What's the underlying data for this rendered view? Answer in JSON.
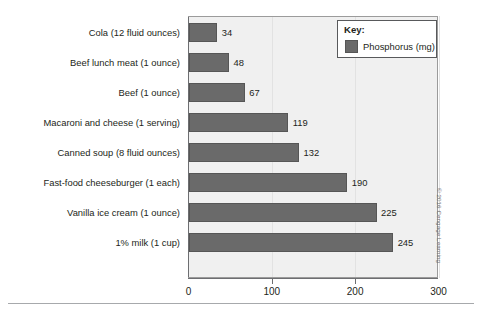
{
  "chart_data": {
    "type": "bar",
    "orientation": "horizontal",
    "title": "",
    "xlabel": "",
    "ylabel": "",
    "xlim": [
      0,
      300
    ],
    "xticks": [
      0,
      100,
      200,
      300
    ],
    "xtick_labels": [
      "0",
      "100",
      "200",
      "300"
    ],
    "grid": true,
    "legend_position": "top-right",
    "legend_title": "Key:",
    "series": [
      {
        "name": "Phosphorus (mg)",
        "color": "#6a6a6a",
        "values": [
          34,
          48,
          67,
          119,
          132,
          190,
          225,
          245
        ]
      }
    ],
    "categories": [
      "Cola (12 fluid ounces)",
      "Beef lunch meat (1 ounce)",
      "Beef (1 ounce)",
      "Macaroni and cheese (1 serving)",
      "Canned soup (8 fluid ounces)",
      "Fast-food cheeseburger (1 each)",
      "Vanilla ice cream (1 ounce)",
      "1% milk (1 cup)"
    ],
    "data_labels": [
      "34",
      "48",
      "67",
      "119",
      "132",
      "190",
      "225",
      "245"
    ]
  },
  "legend": {
    "title": "Key:",
    "items": [
      {
        "label": "Phosphorus (mg)",
        "color": "#6a6a6a"
      }
    ]
  },
  "axis": {
    "ticks": [
      {
        "label": "0",
        "value": 0
      },
      {
        "label": "100",
        "value": 100
      },
      {
        "label": "200",
        "value": 200
      },
      {
        "label": "300",
        "value": 300
      }
    ]
  },
  "rows": [
    {
      "label": "Cola (12 fluid ounces)",
      "value": 34,
      "value_label": "34"
    },
    {
      "label": "Beef lunch meat (1 ounce)",
      "value": 48,
      "value_label": "48"
    },
    {
      "label": "Beef (1 ounce)",
      "value": 67,
      "value_label": "67"
    },
    {
      "label": "Macaroni and cheese (1 serving)",
      "value": 119,
      "value_label": "119"
    },
    {
      "label": "Canned soup (8 fluid ounces)",
      "value": 132,
      "value_label": "132"
    },
    {
      "label": "Fast-food cheeseburger (1 each)",
      "value": 190,
      "value_label": "190"
    },
    {
      "label": "Vanilla ice cream (1 ounce)",
      "value": 225,
      "value_label": "225"
    },
    {
      "label": "1% milk (1 cup)",
      "value": 245,
      "value_label": "245"
    }
  ],
  "credit": {
    "text": "© 2016 Cengage Learning"
  },
  "colors": {
    "bar": "#6a6a6a",
    "bar_border": "#565656",
    "plot_background": "#f0f0f0",
    "axis": "#6d6e71",
    "text": "#231f20",
    "rule": "#a7a9ac"
  }
}
